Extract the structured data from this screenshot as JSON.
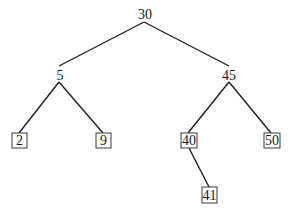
{
  "diagram": {
    "type": "binary-search-tree",
    "nodes": [
      {
        "id": "n30",
        "label": "30",
        "x": 145,
        "y": 14,
        "shape": "plain"
      },
      {
        "id": "n5",
        "label": "5",
        "x": 60,
        "y": 75,
        "shape": "plain"
      },
      {
        "id": "n45",
        "label": "45",
        "x": 229,
        "y": 75,
        "shape": "plain"
      },
      {
        "id": "n2",
        "label": "2",
        "x": 19,
        "y": 140,
        "shape": "box"
      },
      {
        "id": "n9",
        "label": "9",
        "x": 103,
        "y": 140,
        "shape": "box"
      },
      {
        "id": "n40",
        "label": "40",
        "x": 188,
        "y": 140,
        "shape": "box"
      },
      {
        "id": "n50",
        "label": "50",
        "x": 271,
        "y": 140,
        "shape": "box"
      },
      {
        "id": "n41",
        "label": "41",
        "x": 210,
        "y": 195,
        "shape": "box"
      }
    ],
    "edges": [
      {
        "from": "30",
        "to": "5"
      },
      {
        "from": "30",
        "to": "45"
      },
      {
        "from": "5",
        "to": "2"
      },
      {
        "from": "5",
        "to": "9"
      },
      {
        "from": "45",
        "to": "40"
      },
      {
        "from": "45",
        "to": "50"
      },
      {
        "from": "40",
        "to": "41"
      }
    ]
  }
}
